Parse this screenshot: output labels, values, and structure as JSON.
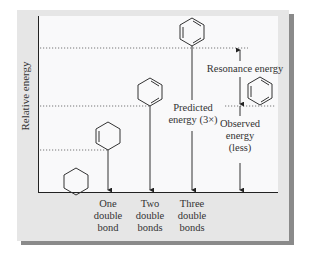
{
  "diagram": {
    "y_axis_label": "Relative energy",
    "x_categories": [
      {
        "label_lines": [
          "One",
          "double",
          "bond"
        ],
        "molecule": "cyclohexene"
      },
      {
        "label_lines": [
          "Two",
          "double",
          "bonds"
        ],
        "molecule": "1,3-cyclohexadiene"
      },
      {
        "label_lines": [
          "Three",
          "double",
          "bonds"
        ],
        "molecule": "hypothetical cyclohexatriene"
      }
    ],
    "baseline_molecule": "cyclohexane",
    "annotations": {
      "predicted": [
        "Predicted",
        "energy (3×)"
      ],
      "observed": [
        "Observed",
        "energy",
        "(less)"
      ],
      "resonance": "Resonance energy"
    },
    "energy_levels_relative": {
      "cyclohexane": 0,
      "one_double_bond": 1,
      "two_double_bonds": 2,
      "three_double_bonds_predicted": 3,
      "benzene_observed": 2
    },
    "colors": {
      "panel_bg": "#e6e6e6",
      "plot_bg": "#f9f9fa",
      "line": "#333333",
      "shadow": "#8a8a8a"
    }
  }
}
